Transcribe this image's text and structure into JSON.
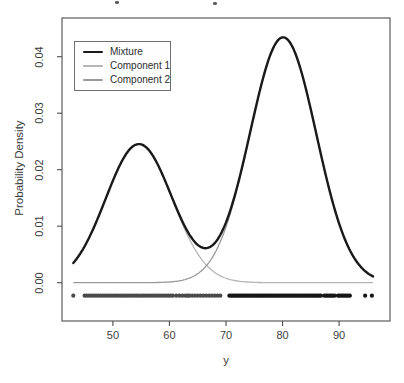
{
  "figure": {
    "background": "#ffffff",
    "box_color": "#4d4d4d",
    "text_color": "#3d3d3d"
  },
  "legend": {
    "items": [
      {
        "label": "Mixture",
        "color": "#1a1a1a",
        "thickness": 2.4
      },
      {
        "label": "Component 1",
        "color": "#b5b5b5",
        "thickness": 1.3
      },
      {
        "label": "Component 2",
        "color": "#9a9a9a",
        "thickness": 1.3
      }
    ]
  },
  "chart_data": {
    "type": "line",
    "title": "",
    "xlabel": "y",
    "ylabel": "Probability Density",
    "xlim": [
      41.0,
      99.0
    ],
    "ylim": [
      -0.00678,
      0.04685
    ],
    "x_ticks": [
      50,
      60,
      70,
      80,
      90
    ],
    "x_tick_labels": [
      "50",
      "60",
      "70",
      "80",
      "90"
    ],
    "y_ticks": [
      0.0,
      0.01,
      0.02,
      0.03,
      0.04
    ],
    "y_tick_labels": [
      "0.00",
      "0.01",
      "0.02",
      "0.03",
      "0.04"
    ],
    "grid": false,
    "legend_position": "top-left",
    "curve_x_range": [
      43,
      96
    ],
    "mixture_components": [
      {
        "name": "Component 1",
        "mean": 54.6,
        "sd": 5.87,
        "weight": 0.361,
        "color": "#b5b5b5",
        "stroke_width": 1.3
      },
      {
        "name": "Component 2",
        "mean": 80.1,
        "sd": 5.87,
        "weight": 0.639,
        "color": "#9a9a9a",
        "stroke_width": 1.3
      }
    ],
    "mixture_series": {
      "name": "Mixture",
      "color": "#1a1a1a",
      "stroke_width": 2.4
    },
    "key_points": {
      "peak_component1": {
        "x": 54.6,
        "density": 0.0245
      },
      "peak_component2": {
        "x": 80.1,
        "density": 0.0434
      },
      "valley": {
        "x": 66.6,
        "density": 0.006
      }
    },
    "rug": {
      "y_density": -0.0023,
      "point_radius": 2.1,
      "split_x": 69.5,
      "color_left": "#4a4a4a",
      "color_right": "#161616",
      "x_values": [
        43,
        45,
        45.4,
        45.8,
        46.2,
        46.6,
        47,
        47.4,
        47.8,
        48.2,
        48.6,
        49,
        49.4,
        49.8,
        50.2,
        50.6,
        51,
        51.4,
        51.8,
        52.2,
        52.6,
        53,
        53.4,
        53.8,
        54.2,
        54.6,
        55,
        55.4,
        55.8,
        56.2,
        56.6,
        57,
        57.4,
        57.8,
        58.2,
        58.6,
        59,
        59.4,
        59.8,
        60.2,
        60.6,
        61.2,
        61.8,
        62.3,
        62.8,
        63.2,
        63.5,
        64,
        64.5,
        65,
        65.5,
        66,
        66.5,
        67,
        67.5,
        68,
        68.5,
        69,
        70.6,
        70.9,
        71.2,
        71.5,
        71.8,
        72.1,
        72.4,
        72.7,
        73,
        73.3,
        73.6,
        73.9,
        74.2,
        74.5,
        74.8,
        75.1,
        75.4,
        75.7,
        76,
        76.3,
        76.6,
        76.9,
        77.2,
        77.5,
        77.8,
        78.1,
        78.4,
        78.7,
        79,
        79.3,
        79.6,
        79.9,
        80.2,
        80.5,
        80.8,
        81.1,
        81.4,
        81.7,
        82,
        82.3,
        82.6,
        82.9,
        83.2,
        83.5,
        83.8,
        84.1,
        84.4,
        84.7,
        85,
        85.3,
        85.6,
        85.9,
        86.2,
        86.5,
        86.8,
        87.4,
        87.7,
        88,
        88.3,
        88.6,
        88.9,
        89.2,
        89.8,
        90.1,
        90.4,
        90.7,
        91,
        91.3,
        91.6,
        91.9,
        94.6,
        95.8
      ]
    }
  },
  "decorations": {
    "cropped_title_marks": [
      {
        "x": 115,
        "y": 1
      },
      {
        "x": 213,
        "y": 2
      }
    ]
  }
}
